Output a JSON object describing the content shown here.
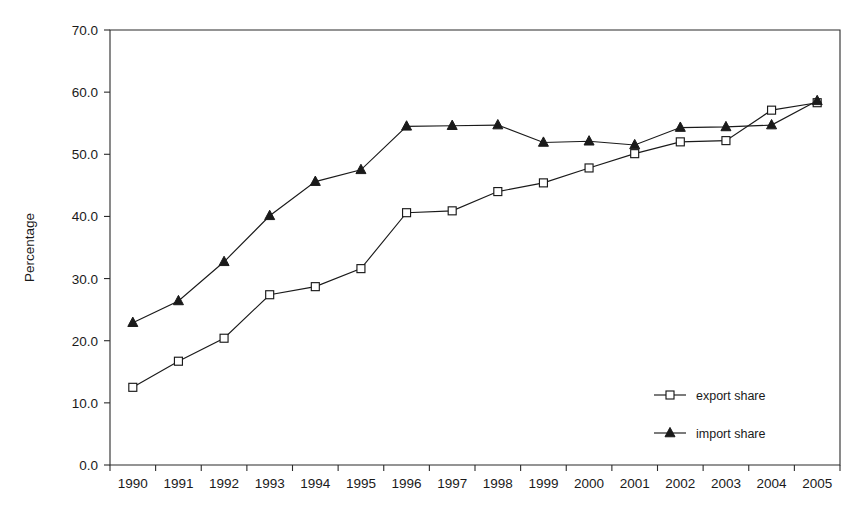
{
  "chart_data": {
    "type": "line",
    "title": "",
    "xlabel": "",
    "ylabel": "Percentage",
    "categories": [
      "1990",
      "1991",
      "1992",
      "1993",
      "1994",
      "1995",
      "1996",
      "1997",
      "1998",
      "1999",
      "2000",
      "2001",
      "2002",
      "2003",
      "2004",
      "2005"
    ],
    "ylim": [
      0.0,
      70.0
    ],
    "y_ticks": [
      "0.0",
      "10.0",
      "20.0",
      "30.0",
      "40.0",
      "50.0",
      "60.0",
      "70.0"
    ],
    "y_tick_values": [
      0.0,
      10.0,
      20.0,
      30.0,
      40.0,
      50.0,
      60.0,
      70.0
    ],
    "grid": false,
    "legend_position": "inside-lower-right",
    "series": [
      {
        "name": "export share",
        "marker": "open-square",
        "values": [
          12.5,
          16.7,
          20.4,
          27.4,
          28.7,
          31.6,
          40.6,
          40.9,
          44.0,
          45.4,
          47.8,
          50.1,
          52.0,
          52.2,
          57.1,
          58.3
        ]
      },
      {
        "name": "import share",
        "marker": "filled-triangle",
        "values": [
          22.9,
          26.4,
          32.7,
          40.1,
          45.6,
          47.5,
          54.5,
          54.6,
          54.7,
          51.9,
          52.1,
          51.5,
          54.3,
          54.4,
          54.7,
          58.6
        ]
      }
    ]
  },
  "legend": {
    "items": [
      {
        "label": "export share"
      },
      {
        "label": "import share"
      }
    ]
  },
  "colors": {
    "ink": "#1a1a1a",
    "axis": "#2b2b2b",
    "background": "#ffffff"
  }
}
